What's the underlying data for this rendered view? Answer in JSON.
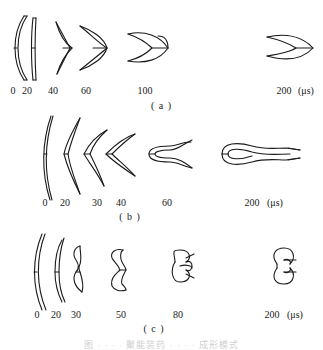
{
  "figure": {
    "unit": "(μs)",
    "panels": [
      {
        "id": "a",
        "label": "( a )",
        "times": [
          "0",
          "20",
          "40",
          "60",
          "100",
          "200"
        ]
      },
      {
        "id": "b",
        "label": "( b )",
        "times": [
          "0",
          "20",
          "30",
          "40",
          "60",
          "200"
        ]
      },
      {
        "id": "c",
        "label": "( c )",
        "times": [
          "0",
          "20",
          "30",
          "50",
          "80",
          "200"
        ]
      }
    ],
    "caption": "图 · · · · 聚能装药 · · · · 成形模式"
  }
}
